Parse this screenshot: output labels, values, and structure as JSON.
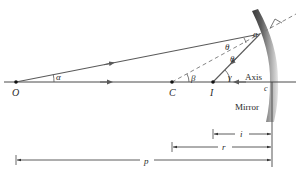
{
  "diagram": {
    "colors": {
      "ray": "#5a5a5a",
      "axis": "#4a4a4a",
      "dashed": "#777777",
      "mirror_dark": "#3a3a3a",
      "mirror_light": "#d8d8d8",
      "text": "#2a2a2a"
    },
    "points": {
      "O": {
        "label": "O",
        "x": 16,
        "y": 82
      },
      "C": {
        "label": "C",
        "x": 172,
        "y": 82
      },
      "I": {
        "label": "I",
        "x": 213,
        "y": 82
      },
      "a": {
        "label": "a",
        "x": 260,
        "y": 34
      },
      "c": {
        "label": "c",
        "x": 271,
        "y": 82
      }
    },
    "angles": {
      "alpha": "α",
      "beta": "β",
      "gamma": "γ",
      "theta_incident": "θ",
      "theta_reflected": "θ"
    },
    "labels": {
      "axis": "Axis",
      "mirror": "Mirror"
    },
    "dimensions": [
      {
        "name": "i",
        "label": "i",
        "from": 213,
        "to": 272,
        "y": 134
      },
      {
        "name": "r",
        "label": "r",
        "from": 172,
        "to": 272,
        "y": 147
      },
      {
        "name": "p",
        "label": "p",
        "from": 16,
        "to": 272,
        "y": 160
      }
    ]
  }
}
